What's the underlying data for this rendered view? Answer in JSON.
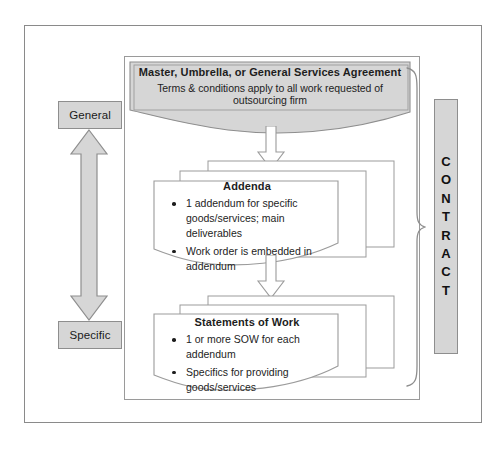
{
  "diagram": {
    "scale": {
      "top_label": "General",
      "bottom_label": "Specific"
    },
    "bracket_label": {
      "text": "CONTRACT",
      "letters": [
        "C",
        "O",
        "N",
        "T",
        "R",
        "A",
        "C",
        "T"
      ]
    },
    "documents": [
      {
        "id": "msa",
        "title": "Master, Umbrella, or General Services Agreement",
        "subtitle": "Terms & conditions apply to all work requested of outsourcing firm",
        "bullets": [],
        "stacked": false,
        "fill": "#d6d6d6"
      },
      {
        "id": "addenda",
        "title": "Addenda",
        "subtitle": "",
        "bullets": [
          "1 addendum for specific goods/services; main deliverables",
          "Work order is embedded in addendum"
        ],
        "stacked": true,
        "fill": "#ffffff"
      },
      {
        "id": "sow",
        "title": "Statements of Work",
        "subtitle": "",
        "bullets": [
          "1 or more SOW for each addendum",
          "Specifics for providing goods/services"
        ],
        "stacked": true,
        "fill": "#ffffff"
      }
    ],
    "colors": {
      "gray_fill": "#d6d6d6",
      "outline": "#8e8e8e",
      "frame": "#8a8a8a",
      "text": "#1d1d1d",
      "page_background": "#ffffff"
    }
  }
}
